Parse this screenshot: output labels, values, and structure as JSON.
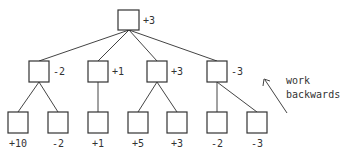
{
  "tree": {
    "root": {
      "value": "+3"
    },
    "level1": [
      {
        "value": "-2"
      },
      {
        "value": "+1"
      },
      {
        "value": "+3"
      },
      {
        "value": "-3"
      }
    ],
    "leaves": [
      {
        "value": "+10"
      },
      {
        "value": "-2"
      },
      {
        "value": "+1"
      },
      {
        "value": "+5"
      },
      {
        "value": "+3"
      },
      {
        "value": "-2"
      },
      {
        "value": "-3"
      }
    ]
  },
  "annotation": {
    "line1": "work",
    "line2": "backwards",
    "arrow": "arrow-up-left"
  }
}
